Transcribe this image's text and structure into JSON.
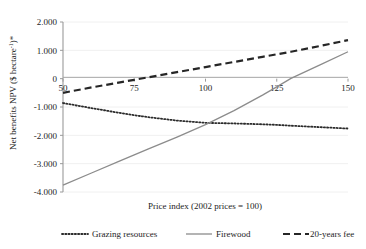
{
  "chart_data": {
    "type": "line",
    "title": "",
    "xlabel": "Price index (2002 prices = 100)",
    "ylabel": "Net benefits NPV ($ hectare",
    "ylabel_sup": "-1",
    "ylabel_tail": ")*",
    "xlim": [
      50,
      150
    ],
    "ylim": [
      -4000,
      2000
    ],
    "grid": true,
    "legend_position": "bottom",
    "x_ticks": [
      50,
      75,
      100,
      125,
      150
    ],
    "x_tick_labels": [
      "50",
      "75",
      "100",
      "125",
      "150"
    ],
    "y_ticks": [
      2000,
      1000,
      0,
      -1000,
      -2000,
      -3000,
      -4000
    ],
    "y_tick_labels": [
      "2.000",
      "1.000",
      "0",
      "-1.000",
      "-2.000",
      "-3.000",
      "-4.000"
    ],
    "x": [
      50,
      60,
      70,
      75,
      80,
      90,
      100,
      110,
      120,
      125,
      130,
      140,
      150
    ],
    "series": [
      {
        "name": "Grazing resources",
        "style": "dotted",
        "color": "#2b2b2b",
        "values": [
          -860,
          -1040,
          -1210,
          -1290,
          -1360,
          -1480,
          -1560,
          -1580,
          -1610,
          -1630,
          -1660,
          -1710,
          -1760
        ]
      },
      {
        "name": "Firewood",
        "style": "solid",
        "color": "#8c8c8c",
        "values": [
          -3760,
          -3330,
          -2900,
          -2690,
          -2480,
          -2060,
          -1620,
          -1130,
          -580,
          -290,
          10,
          480,
          950
        ]
      },
      {
        "name": "20-years fee",
        "style": "dashed",
        "color": "#262626",
        "values": [
          -500,
          -310,
          -130,
          -40,
          50,
          230,
          410,
          590,
          770,
          860,
          950,
          1150,
          1360
        ]
      }
    ]
  },
  "legend": {
    "items": [
      {
        "label": "Grazing resources",
        "style": "dotted",
        "color": "#2b2b2b"
      },
      {
        "label": "Firewood",
        "style": "solid",
        "color": "#8c8c8c"
      },
      {
        "label": "20-years fee",
        "style": "dashed",
        "color": "#262626"
      }
    ]
  },
  "colors": {
    "axis": "#9a9a9a",
    "grid": "#f0f0f0",
    "text": "#1d1d1d",
    "grazing": "#2b2b2b",
    "firewood": "#8c8c8c",
    "fee": "#262626",
    "background": "#ffffff"
  }
}
